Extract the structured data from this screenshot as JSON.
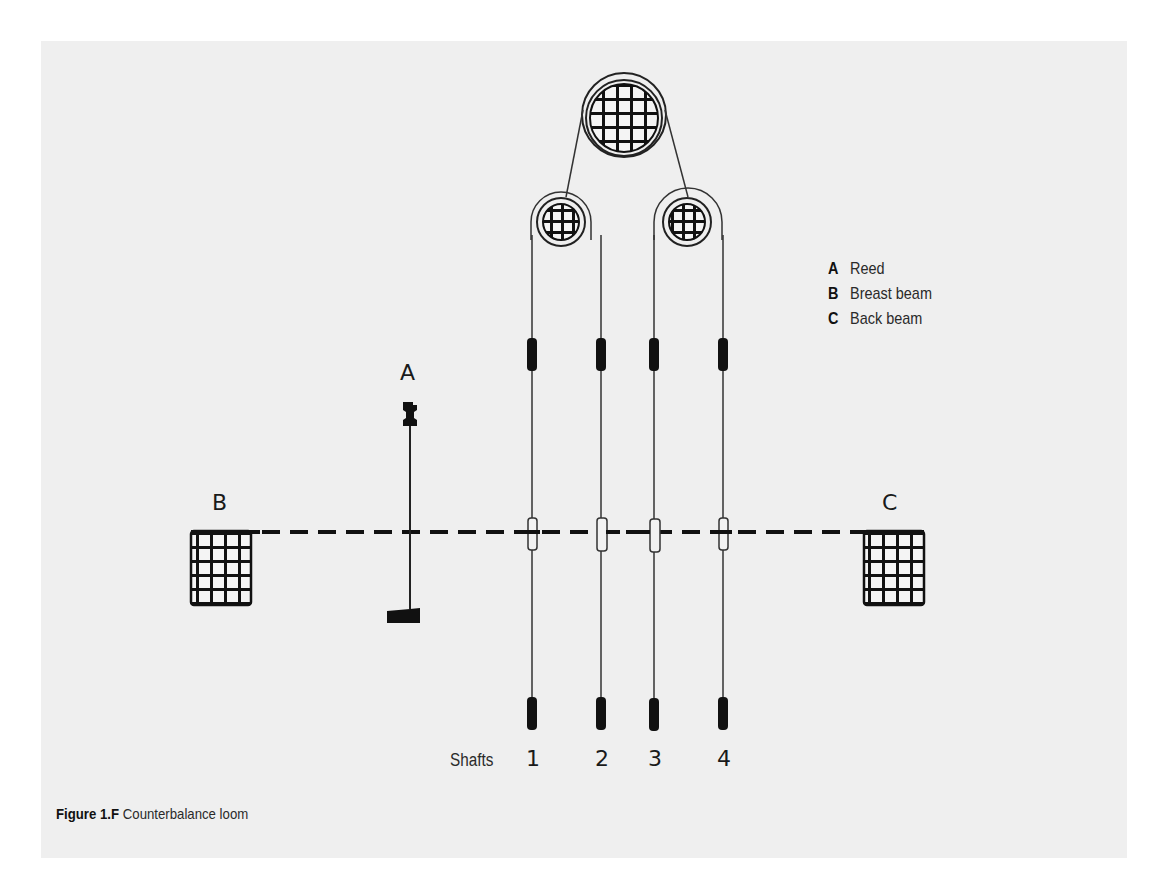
{
  "figure": {
    "caption_label": "Figure 1.F",
    "caption_text": " Counterbalance loom",
    "background_color": "#efefef",
    "ink_color": "#111111"
  },
  "labels": {
    "reed": "A",
    "breast_beam": "B",
    "back_beam": "C"
  },
  "legend": {
    "items": [
      {
        "key": "A",
        "text": "Reed"
      },
      {
        "key": "B",
        "text": "Breast beam"
      },
      {
        "key": "C",
        "text": "Back beam"
      }
    ]
  },
  "shafts": {
    "label": "Shafts",
    "numbers": [
      "1",
      "2",
      "3",
      "4"
    ]
  }
}
